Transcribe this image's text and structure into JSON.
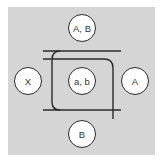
{
  "diagram": {
    "background_color": "#d5d5d5",
    "line_color": "#2a2a2a",
    "nodes": [
      {
        "id": "top",
        "label": "A, B"
      },
      {
        "id": "left",
        "label": "X"
      },
      {
        "id": "center",
        "label": "a, b"
      },
      {
        "id": "right",
        "label": "A"
      },
      {
        "id": "bottom",
        "label": "B"
      }
    ]
  }
}
